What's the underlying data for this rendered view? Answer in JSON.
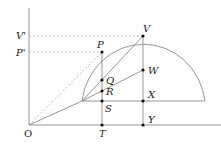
{
  "diagram": {
    "type": "geometric construction",
    "colors": {
      "line": "#8a8a8a",
      "dashed": "#a8a8a8",
      "point": "#111111",
      "label": "#222222"
    },
    "origin": {
      "label": "O"
    },
    "points": [
      {
        "id": "V",
        "label": "V"
      },
      {
        "id": "P",
        "label": "P"
      },
      {
        "id": "Q",
        "label": "Q"
      },
      {
        "id": "R",
        "label": "R"
      },
      {
        "id": "S",
        "label": "S"
      },
      {
        "id": "T",
        "label": "T"
      },
      {
        "id": "W",
        "label": "W"
      },
      {
        "id": "X",
        "label": "X"
      },
      {
        "id": "Y",
        "label": "Y"
      }
    ],
    "axis_labels": [
      {
        "id": "Vprime",
        "label": "V'"
      },
      {
        "id": "Pprime",
        "label": "P'"
      }
    ]
  }
}
